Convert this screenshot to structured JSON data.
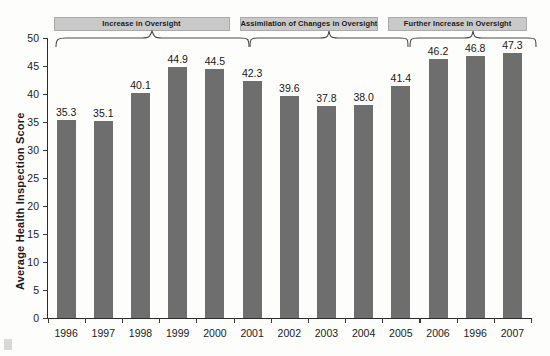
{
  "chart_data": {
    "type": "bar",
    "title": "",
    "xlabel": "",
    "ylabel": "Average Health Inspection Score",
    "ylim": [
      0,
      50
    ],
    "yticks": [
      0,
      5,
      10,
      15,
      20,
      25,
      30,
      35,
      40,
      45,
      50
    ],
    "ytick_labels": [
      "0",
      "5",
      "10",
      "15",
      "20",
      "25",
      "30",
      "35",
      "40",
      "45",
      "50"
    ],
    "grid": false,
    "legend": null,
    "bar_color": "#6e6e6e",
    "categories": [
      "1996",
      "1997",
      "1998",
      "1999",
      "2000",
      "2001",
      "2002",
      "2003",
      "2004",
      "2005",
      "2006",
      "1996",
      "2007"
    ],
    "values": [
      35.3,
      35.1,
      40.1,
      44.9,
      44.5,
      42.3,
      39.6,
      37.8,
      38.0,
      41.4,
      46.2,
      46.8,
      47.3
    ],
    "value_labels": [
      "35.3",
      "35.1",
      "40.1",
      "44.9",
      "44.5",
      "42.3",
      "39.6",
      "37.8",
      "38.0",
      "41.4",
      "46.2",
      "46.8",
      "47.3"
    ],
    "annotations": [
      {
        "label": "Increase in Oversight",
        "spans": [
          "1996",
          "2000"
        ]
      },
      {
        "label": "Assimilation of Changes in Oversight",
        "spans": [
          "2001",
          "2004"
        ]
      },
      {
        "label": "Further Increase in Oversight",
        "spans": [
          "2005",
          "2007"
        ]
      }
    ]
  }
}
